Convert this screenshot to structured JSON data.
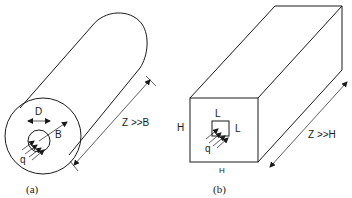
{
  "figure": {
    "panel_a": {
      "caption": "(a)",
      "shape": "cylinder",
      "labels": {
        "inner_diameter": "D",
        "outer_radius": "B",
        "flux": "q",
        "length_condition": "Z >>B"
      }
    },
    "panel_b": {
      "caption": "(b)",
      "shape": "rectangular-prism",
      "labels": {
        "inner_width": "L",
        "inner_height": "L",
        "outer_height": "H",
        "outer_width": "H",
        "flux": "q",
        "length_condition": "Z >>H"
      }
    }
  },
  "colors": {
    "line": "#1a1a1a",
    "background": "#ffffff"
  }
}
